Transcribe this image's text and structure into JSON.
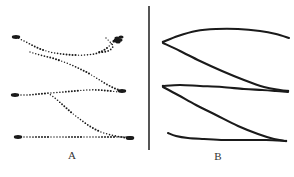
{
  "figure": {
    "width": 294,
    "height": 177,
    "background_color": "#ffffff",
    "ink_color": "#1a1a1a",
    "divider": {
      "name": "panel-divider",
      "x": 149,
      "y_top": 6,
      "y_bottom": 150,
      "width": 1.6,
      "color": "#2b2b2b"
    }
  },
  "panels": [
    {
      "id": "A",
      "label": "A",
      "label_x": 72,
      "label_y": 155,
      "style": "dotted-trajectory",
      "description": "Dotted movement tracks with dark blob markers at track endpoints"
    },
    {
      "id": "B",
      "label": "B",
      "label_x": 218,
      "label_y": 157,
      "style": "solid-curve",
      "description": "Smooth solid curves converging at right-hand vertices"
    }
  ],
  "chart_data": {
    "type": "line",
    "title": "",
    "xlabel": "",
    "ylabel": "",
    "grid": false,
    "legend": null,
    "panel_a": {
      "marker_style": "dotted",
      "dot_radius": 0.85,
      "dot_spacing": 3.0,
      "tracks": [
        {
          "name": "track-a1",
          "points": [
            [
              16,
              37
            ],
            [
              26,
              42
            ],
            [
              38,
              48
            ],
            [
              50,
              52
            ],
            [
              62,
              54
            ],
            [
              74,
              55
            ],
            [
              86,
              55
            ],
            [
              98,
              53
            ],
            [
              107,
              48
            ],
            [
              113,
              42
            ],
            [
              118,
              39
            ]
          ],
          "blobs": [
            [
              16,
              37
            ],
            [
              118,
              40
            ]
          ]
        },
        {
          "name": "track-a2",
          "points": [
            [
              30,
              52
            ],
            [
              40,
              55
            ],
            [
              52,
              58
            ],
            [
              64,
              62
            ],
            [
              76,
              67
            ],
            [
              88,
              73
            ],
            [
              98,
              79
            ],
            [
              108,
              85
            ],
            [
              116,
              89
            ],
            [
              122,
              91
            ]
          ],
          "blobs": [
            [
              122,
              91
            ]
          ]
        },
        {
          "name": "track-a3",
          "points": [
            [
              15,
              95
            ],
            [
              27,
              95
            ],
            [
              39,
              94
            ],
            [
              51,
              93
            ],
            [
              63,
              92
            ],
            [
              75,
              91
            ],
            [
              87,
              90
            ],
            [
              99,
              90
            ],
            [
              110,
              91
            ],
            [
              119,
              92
            ]
          ],
          "blobs": [
            [
              15,
              95
            ]
          ]
        },
        {
          "name": "track-a4",
          "points": [
            [
              48,
              93
            ],
            [
              56,
              99
            ],
            [
              64,
              106
            ],
            [
              72,
              113
            ],
            [
              81,
              120
            ],
            [
              91,
              127
            ],
            [
              101,
              132
            ],
            [
              111,
              135
            ],
            [
              121,
              137
            ],
            [
              129,
              138
            ]
          ],
          "blobs": [
            [
              130,
              138
            ]
          ]
        },
        {
          "name": "track-a5",
          "points": [
            [
              18,
              137
            ],
            [
              30,
              137
            ],
            [
              42,
              137
            ],
            [
              54,
              137
            ],
            [
              66,
              137
            ],
            [
              78,
              137
            ],
            [
              90,
              137
            ],
            [
              102,
              137
            ],
            [
              114,
              137
            ],
            [
              126,
              137
            ]
          ],
          "blobs": [
            [
              18,
              137
            ],
            [
              130,
              138
            ]
          ]
        },
        {
          "name": "track-a6",
          "points": [
            [
              106,
              38
            ],
            [
              110,
              42
            ],
            [
              113,
              46
            ],
            [
              110,
              50
            ],
            [
              104,
              52
            ],
            [
              97,
              52
            ]
          ],
          "blobs": []
        }
      ]
    },
    "panel_b": {
      "marker_style": "solid",
      "line_width": 2.1,
      "curves": [
        {
          "name": "curve-b1-upper",
          "points": [
            [
              163,
              42
            ],
            [
              178,
              36
            ],
            [
              196,
              31
            ],
            [
              216,
              29
            ],
            [
              238,
              29
            ],
            [
              260,
              31
            ],
            [
              276,
              34
            ],
            [
              289,
              38
            ]
          ]
        },
        {
          "name": "curve-b1-lower",
          "points": [
            [
              163,
              43
            ],
            [
              180,
              51
            ],
            [
              200,
              61
            ],
            [
              222,
              71
            ],
            [
              244,
              80
            ],
            [
              264,
              87
            ],
            [
              280,
              90
            ],
            [
              288,
              91
            ]
          ]
        },
        {
          "name": "curve-b2-upper",
          "points": [
            [
              163,
              86
            ],
            [
              180,
              85
            ],
            [
              200,
              86
            ],
            [
              222,
              87
            ],
            [
              244,
              89
            ],
            [
              262,
              90
            ],
            [
              276,
              91
            ],
            [
              288,
              92
            ]
          ]
        },
        {
          "name": "curve-b2-lower",
          "points": [
            [
              163,
              87
            ],
            [
              178,
              95
            ],
            [
              196,
              105
            ],
            [
              216,
              115
            ],
            [
              238,
              126
            ],
            [
              258,
              134
            ],
            [
              274,
              139
            ],
            [
              286,
              141
            ]
          ]
        },
        {
          "name": "curve-b3-base",
          "points": [
            [
              168,
              133
            ],
            [
              176,
              136
            ],
            [
              188,
              138
            ],
            [
              204,
              139
            ],
            [
              224,
              140
            ],
            [
              246,
              140
            ],
            [
              266,
              140
            ],
            [
              286,
              141
            ]
          ]
        }
      ],
      "vertices": [
        [
          163,
          42
        ],
        [
          163,
          86
        ],
        [
          286,
          141
        ],
        [
          288,
          91
        ]
      ]
    }
  }
}
